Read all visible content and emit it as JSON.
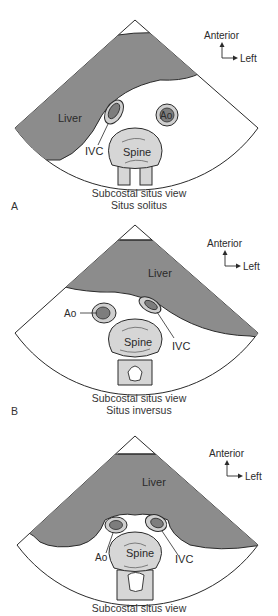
{
  "figure": {
    "colors": {
      "liver": "#8c8c8c",
      "vessel_wall": "#cfcfcf",
      "vessel_lumen": "#7d7d7d",
      "spine": "#d6d6d6",
      "outline": "#2a2a2a",
      "background": "#ffffff"
    },
    "orientation": {
      "up_label": "Anterior",
      "right_label": "Left"
    },
    "panels": [
      {
        "letter": "A",
        "caption_line1": "Subcostal situs view",
        "caption_line2": "Situs solitus",
        "labels": {
          "liver": "Liver",
          "ivc": "IVC",
          "ao": "Ao",
          "spine": "Spine"
        }
      },
      {
        "letter": "B",
        "caption_line1": "Subcostal situs view",
        "caption_line2": "Situs inversus",
        "labels": {
          "liver": "Liver",
          "ivc": "IVC",
          "ao": "Ao",
          "spine": "Spine"
        }
      },
      {
        "letter": "",
        "caption_line1": "Subcostal situs view",
        "caption_line2": "",
        "labels": {
          "liver": "Liver",
          "ivc": "IVC",
          "ao": "Ao",
          "spine": "Spine"
        }
      }
    ]
  }
}
